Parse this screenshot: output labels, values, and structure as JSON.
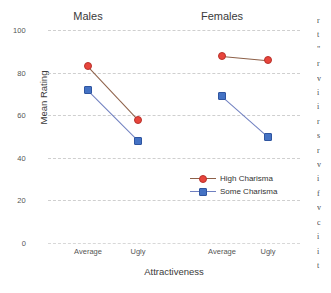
{
  "chart_data": {
    "type": "line",
    "title": "",
    "xlabel": "Attractiveness",
    "ylabel": "Mean Rating",
    "ylim": [
      0,
      100
    ],
    "yticks": [
      0,
      20,
      40,
      60,
      80,
      100
    ],
    "grid": true,
    "legend_position": "center-right",
    "panels": [
      {
        "name": "Males",
        "categories": [
          "Average",
          "Ugly"
        ],
        "series": [
          {
            "name": "High Charisma",
            "values": [
              83,
              58
            ]
          },
          {
            "name": "Some Charisma",
            "values": [
              72,
              48
            ]
          }
        ]
      },
      {
        "name": "Females",
        "categories": [
          "Average",
          "Ugly"
        ],
        "series": [
          {
            "name": "High Charisma",
            "values": [
              88,
              86
            ]
          },
          {
            "name": "Some Charisma",
            "values": [
              69,
              50
            ]
          }
        ]
      }
    ],
    "series_styles": [
      {
        "name": "High Charisma",
        "color": "#e8453c",
        "marker": "circle",
        "line_color": "#8d6048"
      },
      {
        "name": "Some Charisma",
        "color": "#4472c4",
        "marker": "square",
        "line_color": "#6f7fc0"
      }
    ],
    "legend": [
      "High Charisma",
      "Some Charisma"
    ]
  },
  "axis": {
    "y_label": "Mean Rating",
    "x_label": "Attractiveness",
    "y_ticks": [
      "100",
      "80",
      "60",
      "40",
      "20",
      "0"
    ],
    "x_ticks": [
      "Average",
      "Ugly",
      "Average",
      "Ugly"
    ]
  },
  "panels": {
    "left_title": "Males",
    "right_title": "Females"
  },
  "legend": {
    "high": "High Charisma",
    "some": "Some Charisma"
  },
  "edge_text": {
    "lines": [
      "r",
      "t",
      "\"",
      "",
      "r",
      "v",
      "",
      "i",
      "i",
      "r",
      "s",
      "",
      "r",
      "v",
      "i",
      "f",
      "",
      "v",
      "",
      "c",
      "i",
      "i",
      "t"
    ]
  }
}
